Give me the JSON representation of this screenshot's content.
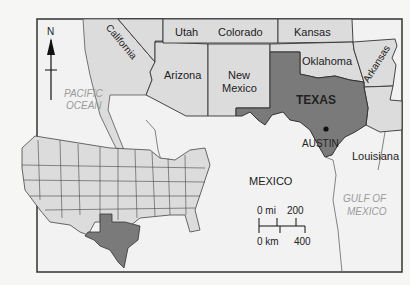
{
  "map": {
    "title": "Texas location map",
    "colors": {
      "land": "#dcdcdc",
      "highlight": "#7a7a7a",
      "water": "#f2f2f2",
      "border": "#333333",
      "background": "#f6f6f4"
    },
    "compass": {
      "label": "N"
    },
    "states": [
      {
        "name": "California"
      },
      {
        "name": "Utah"
      },
      {
        "name": "Colorado"
      },
      {
        "name": "Kansas"
      },
      {
        "name": "Arizona"
      },
      {
        "name": "New Mexico",
        "line1": "New",
        "line2": "Mexico"
      },
      {
        "name": "Oklahoma"
      },
      {
        "name": "Arkansas"
      },
      {
        "name": "Louisiana"
      }
    ],
    "highlighted_state": {
      "name": "TEXAS"
    },
    "capital": {
      "name": "AUSTIN"
    },
    "country": {
      "name": "MEXICO"
    },
    "water_bodies": [
      {
        "line1": "PACIFIC",
        "line2": "OCEAN"
      },
      {
        "line1": "GULF OF",
        "line2": "MEXICO"
      }
    ],
    "scale_bar": {
      "mi_start": "0 mi",
      "mi_end": "200",
      "km_start": "0 km",
      "km_end": "400"
    },
    "inset": {
      "description": "Contiguous United States with Texas highlighted"
    }
  }
}
